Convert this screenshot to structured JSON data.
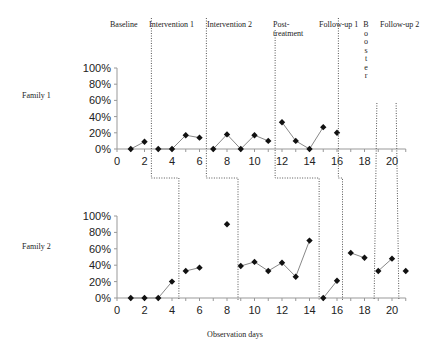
{
  "chart_data": [
    {
      "type": "line",
      "title": "Family 1",
      "xlabel": "Observation days",
      "ylabel": "",
      "ylim": [
        0,
        100
      ],
      "xlim": [
        0,
        21
      ],
      "yticks": [
        "0%",
        "20%",
        "40%",
        "60%",
        "80%",
        "100%"
      ],
      "xticks": [
        "0",
        "2",
        "4",
        "6",
        "8",
        "10",
        "12",
        "14",
        "16",
        "18",
        "20"
      ],
      "phases": [
        "Baseline",
        "Intervention 1",
        "Intervention 2",
        "Post-treatment",
        "Follow-up 1",
        "Booster",
        "Follow-up 2"
      ],
      "series": [
        {
          "name": "Baseline",
          "x": [
            1,
            2
          ],
          "values": [
            0,
            9
          ]
        },
        {
          "name": "Intervention 1",
          "x": [
            3,
            4,
            5,
            6
          ],
          "values": [
            0,
            0,
            17,
            14
          ]
        },
        {
          "name": "Intervention 2",
          "x": [
            7,
            8,
            9,
            10,
            11
          ],
          "values": [
            0,
            18,
            0,
            17,
            10
          ]
        },
        {
          "name": "Post-treatment",
          "x": [
            12,
            13,
            14,
            15
          ],
          "values": [
            33,
            10,
            0,
            27
          ]
        },
        {
          "name": "Follow-up 1",
          "x": [
            16
          ],
          "values": [
            20
          ]
        }
      ],
      "phase_lines": [
        2.5,
        6.5,
        11.5,
        16.1,
        18.9,
        20.3
      ]
    },
    {
      "type": "line",
      "title": "Family 2",
      "xlabel": "Observation days",
      "ylabel": "",
      "ylim": [
        0,
        100
      ],
      "xlim": [
        0,
        21
      ],
      "yticks": [
        "0%",
        "20%",
        "40%",
        "60%",
        "80%",
        "100%"
      ],
      "xticks": [
        "0",
        "2",
        "4",
        "6",
        "8",
        "10",
        "12",
        "14",
        "16",
        "18",
        "20"
      ],
      "series": [
        {
          "name": "Baseline",
          "x": [
            1,
            2,
            3,
            4
          ],
          "values": [
            0,
            0,
            0,
            20
          ]
        },
        {
          "name": "Intervention 1",
          "x": [
            5,
            6
          ],
          "values": [
            33,
            37
          ]
        },
        {
          "name": "Intervention 1 (isolated)",
          "x": [
            8
          ],
          "values": [
            90
          ]
        },
        {
          "name": "Intervention 2",
          "x": [
            9,
            10,
            11,
            12,
            13,
            14
          ],
          "values": [
            39,
            44,
            33,
            43,
            26,
            70
          ]
        },
        {
          "name": "Post-treatment",
          "x": [
            15,
            16
          ],
          "values": [
            0,
            21
          ]
        },
        {
          "name": "Follow-up 1",
          "x": [
            17,
            18
          ],
          "values": [
            55,
            49
          ]
        },
        {
          "name": "Booster",
          "x": [
            19,
            20
          ],
          "values": [
            33,
            48
          ]
        },
        {
          "name": "Follow-up 2",
          "x": [
            21
          ],
          "values": [
            33
          ]
        }
      ],
      "phase_lines": [
        4.5,
        8.8,
        14.7,
        16.4,
        18.7,
        20.5
      ]
    }
  ],
  "labels": {
    "family1": "Family 1",
    "family2": "Family 2",
    "xlabel": "Observation days",
    "phase_baseline": "Baseline",
    "phase_int1": "Intervention 1",
    "phase_int2": "Intervention 2",
    "phase_post_1": "Post-",
    "phase_post_2": "treatment",
    "phase_fu1": "Follow-up 1",
    "phase_booster": [
      "B",
      "o",
      "o",
      "s",
      "t",
      "e",
      "r"
    ],
    "phase_fu2": "Follow-up 2"
  }
}
